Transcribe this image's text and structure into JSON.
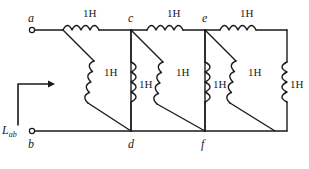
{
  "figure": {
    "kind": "circuit-diagram",
    "line_color": "#1a1a1a",
    "background_color": "#ffffff",
    "terminal_label": "L",
    "terminal_subscript": "ab"
  },
  "nodes": [
    {
      "id": "a",
      "label": "a",
      "x": 32,
      "y": 30,
      "terminal": true
    },
    {
      "id": "b",
      "label": "b",
      "x": 32,
      "y": 131,
      "terminal": true
    },
    {
      "id": "c",
      "label": "c",
      "x": 131,
      "y": 30,
      "terminal": false
    },
    {
      "id": "d",
      "label": "d",
      "x": 131,
      "y": 131,
      "terminal": false
    },
    {
      "id": "e",
      "label": "e",
      "x": 205,
      "y": 30,
      "terminal": false
    },
    {
      "id": "f",
      "label": "f",
      "x": 205,
      "y": 131,
      "terminal": false
    }
  ],
  "inductors": [
    {
      "id": "L-ac",
      "value": "1H",
      "orientation": "horizontal",
      "from": "a",
      "to": "c",
      "label_x": 83,
      "label_y": 9
    },
    {
      "id": "L-ce",
      "value": "1H",
      "orientation": "horizontal",
      "from": "c",
      "to": "e",
      "label_x": 167,
      "label_y": 9
    },
    {
      "id": "L-er",
      "value": "1H",
      "orientation": "horizontal",
      "from": "e",
      "to": "right-top",
      "label_x": 240,
      "label_y": 9
    },
    {
      "id": "L-ad",
      "value": "1H",
      "orientation": "diagonal",
      "from": "a",
      "to": "d",
      "label_x": 104,
      "label_y": 71
    },
    {
      "id": "L-cd",
      "value": "1H",
      "orientation": "vertical",
      "from": "c",
      "to": "d",
      "label_x": 140,
      "label_y": 82
    },
    {
      "id": "L-cf",
      "value": "1H",
      "orientation": "diagonal",
      "from": "c",
      "to": "f",
      "label_x": 177,
      "label_y": 71
    },
    {
      "id": "L-ef",
      "value": "1H",
      "orientation": "vertical",
      "from": "e",
      "to": "f",
      "label_x": 214,
      "label_y": 82
    },
    {
      "id": "L-ebr",
      "value": "1H",
      "orientation": "diagonal",
      "from": "e",
      "to": "right-bottom",
      "label_x": 248,
      "label_y": 71
    },
    {
      "id": "L-rr",
      "value": "1H",
      "orientation": "vertical",
      "from": "right-top",
      "to": "right-bottom",
      "label_x": 285,
      "label_y": 82
    }
  ],
  "annotations": {
    "current_arrow": {
      "name": "current-direction-arrow",
      "from_x": 18,
      "from_y": 125,
      "to_x": 18,
      "to_y": 84,
      "tip_x": 52,
      "tip_y": 84
    },
    "terminal_text": {
      "x": 2,
      "y": 125
    }
  },
  "rails": {
    "top": {
      "y": 30,
      "x_start": 35,
      "x_end": 287
    },
    "bottom": {
      "y": 131,
      "x_start": 35,
      "x_end": 287
    }
  }
}
